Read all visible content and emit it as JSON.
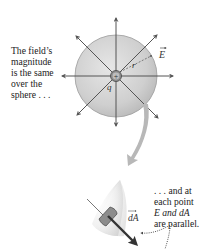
{
  "figure": {
    "caption_top": [
      "The field’s",
      "magnitude",
      "is the same",
      "over the",
      "sphere . . ."
    ],
    "caption_bottom": [
      ". . . and at",
      "each point",
      "E and dA",
      "are parallel."
    ],
    "labels": {
      "field": "E",
      "radius": "r",
      "charge": "q",
      "charge_sign": "+",
      "area_element": "dA"
    },
    "colors": {
      "sphere_fill": "#c9c9c9",
      "sphere_edge": "#9a9a9a",
      "field_lines": "#555555",
      "curved_arrow": "#b8b8b8",
      "patch_fill": "#8a8a8a",
      "vector_arrow": "#3a3a3a"
    }
  }
}
